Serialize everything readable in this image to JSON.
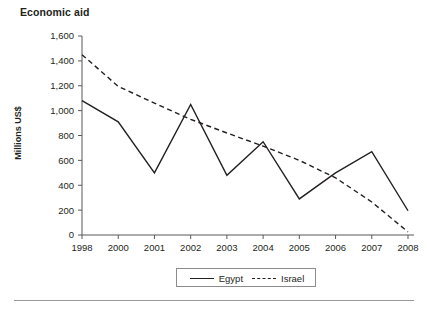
{
  "figure": {
    "title": "Economic aid",
    "y_axis_title": "Millions US$",
    "legend_position": "bottom-center"
  },
  "legend": {
    "entries": [
      {
        "label": "Egypt",
        "style": "solid",
        "icon": "solid-line-icon"
      },
      {
        "label": "Israel",
        "style": "dashed",
        "icon": "dashed-line-icon"
      }
    ]
  },
  "axes": {
    "y_ticks": [
      "1,600",
      "1,400",
      "1,200",
      "1,000",
      "800",
      "600",
      "400",
      "200",
      "0"
    ],
    "x_ticks": [
      "1998",
      "2000",
      "2001",
      "2002",
      "2003",
      "2004",
      "2005",
      "2006",
      "2007",
      "2008"
    ]
  },
  "chart_data": {
    "type": "line",
    "title": "Economic aid",
    "xlabel": "",
    "ylabel": "Millions US$",
    "ylim": [
      0,
      1600
    ],
    "ytick_values": [
      0,
      200,
      400,
      600,
      800,
      1000,
      1200,
      1400,
      1600
    ],
    "grid": false,
    "legend": "bottom-center",
    "categories": [
      "1998",
      "2000",
      "2001",
      "2002",
      "2003",
      "2004",
      "2005",
      "2006",
      "2007",
      "2008"
    ],
    "series": [
      {
        "name": "Egypt",
        "style": "solid",
        "values": [
          1080,
          910,
          500,
          1050,
          480,
          750,
          290,
          500,
          670,
          195
        ]
      },
      {
        "name": "Israel",
        "style": "dashed",
        "values": [
          1450,
          1195,
          1060,
          930,
          820,
          715,
          600,
          460,
          265,
          25
        ]
      }
    ]
  }
}
